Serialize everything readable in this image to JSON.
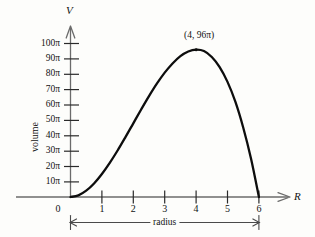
{
  "figure": {
    "title": "",
    "y_axis_name": "V",
    "x_axis_name": "R",
    "y_axis_caption": "volume",
    "x_axis_caption": "radius",
    "peak_annotation": "(4, 96π)",
    "curve_color": "#0d0d0d",
    "axis_color": "#6b6b6b",
    "text_color": "#121212",
    "background_color": "#fdfdfb"
  },
  "chart_data": {
    "type": "line",
    "title": "",
    "xlabel": "radius",
    "ylabel": "volume",
    "x_axis_symbol": "R",
    "y_axis_symbol": "V",
    "xlim": [
      0,
      6
    ],
    "ylim": [
      0,
      100
    ],
    "y_unit": "π",
    "grid": false,
    "legend": "none",
    "xticks": [
      0,
      1,
      2,
      3,
      4,
      5,
      6
    ],
    "xtick_labels": [
      "0",
      "1",
      "2",
      "3",
      "4",
      "5",
      "6"
    ],
    "yticks": [
      10,
      20,
      30,
      40,
      50,
      60,
      70,
      80,
      90,
      100
    ],
    "ytick_labels": [
      "10π",
      "20π",
      "30π",
      "40π",
      "50π",
      "60π",
      "70π",
      "80π",
      "90π",
      "100π"
    ],
    "annotations": [
      {
        "text": "(4, 96π)",
        "x": 4,
        "y": 96
      }
    ],
    "series": [
      {
        "name": "volume",
        "x": [
          0,
          0.25,
          0.5,
          0.75,
          1,
          1.25,
          1.5,
          1.75,
          2,
          2.25,
          2.5,
          2.75,
          3,
          3.25,
          3.5,
          3.75,
          4,
          4.25,
          4.5,
          4.75,
          5,
          5.25,
          5.5,
          5.75,
          6
        ],
        "values": [
          0,
          0.36,
          1.38,
          2.95,
          5,
          7.42,
          10.1,
          13.0,
          16.0,
          19.0,
          21.9,
          24.6,
          27.0,
          29.0,
          30.6,
          31.6,
          32.0,
          31.7,
          30.4,
          28.2,
          25.0,
          20.7,
          15.1,
          8.3,
          0
        ]
      }
    ]
  }
}
